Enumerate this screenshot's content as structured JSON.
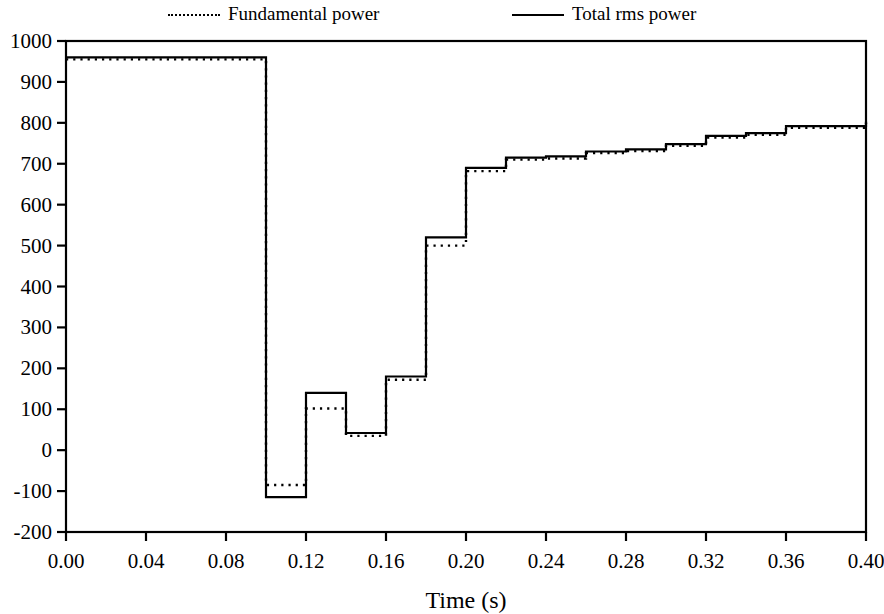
{
  "legend": {
    "items": [
      {
        "label": "Fundamental power",
        "style": "dotted",
        "key": "fundamental"
      },
      {
        "label": "Total rms power",
        "style": "solid",
        "key": "total"
      }
    ]
  },
  "chart_data": {
    "type": "line",
    "title": "",
    "subtitle": "",
    "xlabel": "Time (s)",
    "ylabel": "",
    "xlim": [
      0.0,
      0.4
    ],
    "ylim": [
      -200,
      1000
    ],
    "xticks": [
      0.0,
      0.04,
      0.08,
      0.12,
      0.16,
      0.2,
      0.24,
      0.28,
      0.32,
      0.36,
      0.4
    ],
    "xtick_labels": [
      "0.00",
      "0.04",
      "0.08",
      "0.12",
      "0.16",
      "0.20",
      "0.24",
      "0.28",
      "0.32",
      "0.36",
      "0.40"
    ],
    "yticks": [
      -200,
      -100,
      0,
      100,
      200,
      300,
      400,
      500,
      600,
      700,
      800,
      900,
      1000
    ],
    "ytick_labels": [
      "-200",
      "-100",
      "0",
      "100",
      "200",
      "300",
      "400",
      "500",
      "600",
      "700",
      "800",
      "900",
      "1000"
    ],
    "grid": false,
    "legend_position": "top",
    "step_style": "post",
    "series": [
      {
        "name": "Total rms power",
        "style": "solid",
        "color": "#000000",
        "x": [
          0.0,
          0.1,
          0.12,
          0.14,
          0.16,
          0.18,
          0.2,
          0.22,
          0.24,
          0.26,
          0.28,
          0.3,
          0.32,
          0.34,
          0.36,
          0.4
        ],
        "values": [
          960,
          -115,
          140,
          42,
          180,
          520,
          690,
          715,
          718,
          730,
          735,
          748,
          768,
          775,
          792,
          803
        ]
      },
      {
        "name": "Fundamental power",
        "style": "dotted",
        "color": "#000000",
        "x": [
          0.0,
          0.1,
          0.12,
          0.14,
          0.16,
          0.18,
          0.2,
          0.22,
          0.24,
          0.26,
          0.28,
          0.3,
          0.32,
          0.34,
          0.36,
          0.4
        ],
        "values": [
          955,
          -85,
          102,
          35,
          172,
          500,
          682,
          710,
          713,
          726,
          731,
          744,
          764,
          771,
          788,
          800
        ]
      }
    ]
  }
}
